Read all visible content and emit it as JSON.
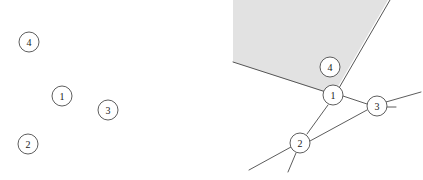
{
  "figure": {
    "width": 423,
    "height": 180,
    "background": "#ffffff",
    "stroke_color": "#4a4a4a",
    "node_fill": "#ffffff",
    "node_stroke": "#4c4c4c",
    "region_fill": "#e2e2e2",
    "region_stroke": "#555555",
    "node_radius": 10
  },
  "panels": [
    {
      "id": "left-panel",
      "name": "isolated-vertices-panel",
      "description": "Four numbered vertices with no edges",
      "nodes": [
        {
          "label": "4",
          "cx": 29,
          "cy": 42,
          "r": 10
        },
        {
          "label": "1",
          "cx": 62,
          "cy": 96,
          "r": 10
        },
        {
          "label": "3",
          "cx": 108,
          "cy": 110,
          "r": 10
        },
        {
          "label": "2",
          "cx": 28,
          "cy": 144,
          "r": 10
        }
      ],
      "edges": [],
      "regions": []
    },
    {
      "id": "right-panel",
      "name": "embedded-graph-panel",
      "description": "Same four vertices connected by edges with one shaded face",
      "nodes": [
        {
          "label": "4",
          "cx": 330,
          "cy": 67,
          "r": 10
        },
        {
          "label": "1",
          "cx": 333,
          "cy": 95,
          "r": 10
        },
        {
          "label": "3",
          "cx": 377,
          "cy": 106,
          "r": 10
        },
        {
          "label": "2",
          "cx": 300,
          "cy": 143,
          "r": 10
        }
      ],
      "regions": [
        {
          "name": "shaded-face",
          "fill": "#e2e2e2",
          "points": "233,0 388,0 333,95 233,62"
        }
      ],
      "region_boundaries": [
        {
          "name": "region-edge-left",
          "x1": 233,
          "y1": 62,
          "x2": 325,
          "y2": 92
        },
        {
          "name": "region-edge-right",
          "x1": 390,
          "y1": 0,
          "x2": 339,
          "y2": 88
        },
        {
          "name": "region-edge-vertical",
          "x1": 233,
          "y1": 0,
          "x2": 233,
          "y2": 62
        }
      ],
      "edges": [
        {
          "name": "edge-1-3",
          "x1": 343,
          "y1": 96,
          "x2": 367,
          "y2": 104
        },
        {
          "name": "edge-1-2",
          "x1": 328,
          "y1": 105,
          "x2": 307,
          "y2": 134
        },
        {
          "name": "edge-2-3",
          "x1": 310,
          "y1": 141,
          "x2": 367,
          "y2": 110
        },
        {
          "name": "edge-2-southwest",
          "x1": 291,
          "y1": 147,
          "x2": 249,
          "y2": 170
        },
        {
          "name": "edge-2-south",
          "x1": 296,
          "y1": 153,
          "x2": 288,
          "y2": 172
        },
        {
          "name": "edge-2-northeast-stub",
          "x1": 306,
          "y1": 134,
          "x2": 322,
          "y2": 112
        },
        {
          "name": "edge-3-northeast",
          "x1": 386,
          "y1": 102,
          "x2": 420,
          "y2": 92
        },
        {
          "name": "edge-3-east-stub",
          "x1": 387,
          "y1": 107,
          "x2": 396,
          "y2": 107
        },
        {
          "name": "edge-3-southwest-tail",
          "x1": 367,
          "y1": 110,
          "x2": 310,
          "y2": 141
        }
      ]
    }
  ]
}
